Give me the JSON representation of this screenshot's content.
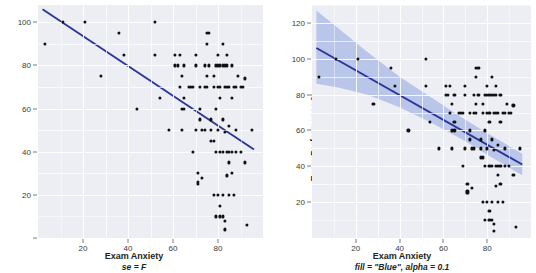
{
  "figure": {
    "background": "#ffffff",
    "panel_background": "#eceef3",
    "grid_color": "#ffffff",
    "point_color": "#111111",
    "line_color": "#2b3499",
    "band_color": "#b9c5e9"
  },
  "panels": [
    {
      "id": "left",
      "ylabel": "Exam Performance %",
      "xlabel": "Exam Anxiety",
      "caption": "se = F",
      "yticks": [
        20,
        40,
        60,
        80,
        100
      ],
      "xticks": [
        20,
        40,
        60,
        80
      ],
      "ylim": [
        0,
        108
      ],
      "xlim": [
        0,
        100
      ],
      "show_band": false,
      "fit_line": {
        "x1": 2,
        "y1": 106,
        "x2": 96,
        "y2": 41
      }
    },
    {
      "id": "right",
      "ylabel": "Exam Performance %",
      "xlabel": "Exam Anxiety",
      "caption": "fill = \"Blue\", alpha = 0.1",
      "yticks": [
        20,
        40,
        60,
        80,
        100,
        120
      ],
      "xticks": [
        20,
        40,
        60,
        80
      ],
      "ylim": [
        0,
        130
      ],
      "xlim": [
        0,
        100
      ],
      "show_band": true,
      "fit_line": {
        "x1": 2,
        "y1": 106,
        "x2": 96,
        "y2": 41
      },
      "band_upper": [
        [
          2,
          127
        ],
        [
          12,
          117
        ],
        [
          25,
          104
        ],
        [
          40,
          90
        ],
        [
          55,
          78
        ],
        [
          70,
          66
        ],
        [
          82,
          57
        ],
        [
          96,
          47
        ]
      ],
      "band_lower": [
        [
          2,
          86
        ],
        [
          12,
          84
        ],
        [
          25,
          80
        ],
        [
          40,
          73
        ],
        [
          55,
          64
        ],
        [
          70,
          54
        ],
        [
          82,
          45
        ],
        [
          96,
          35
        ]
      ]
    }
  ],
  "chart_data": {
    "type": "scatter",
    "title": "",
    "xlabel": "Exam Anxiety",
    "ylabel": "Exam Performance %",
    "xlim": [
      0,
      100
    ],
    "ylim_left": [
      0,
      108
    ],
    "ylim_right": [
      0,
      130
    ],
    "grid": true,
    "legend": "none",
    "annotations": [
      "se = F",
      "fill = \"Blue\", alpha = 0.1"
    ],
    "regression_line": {
      "x_start": 2,
      "y_start": 106,
      "x_end": 96,
      "y_end": 41
    },
    "points": [
      [
        3,
        90
      ],
      [
        11,
        100
      ],
      [
        21,
        100
      ],
      [
        28,
        75
      ],
      [
        36,
        95
      ],
      [
        38,
        85
      ],
      [
        44,
        60
      ],
      [
        52,
        100
      ],
      [
        52,
        85
      ],
      [
        54,
        65
      ],
      [
        58,
        50
      ],
      [
        61,
        80
      ],
      [
        61,
        85
      ],
      [
        62,
        80
      ],
      [
        63,
        70
      ],
      [
        63,
        85
      ],
      [
        64,
        60
      ],
      [
        64,
        75
      ],
      [
        64,
        50
      ],
      [
        65,
        80
      ],
      [
        65,
        65
      ],
      [
        65,
        60
      ],
      [
        67,
        70
      ],
      [
        68,
        70
      ],
      [
        69,
        70
      ],
      [
        69,
        40
      ],
      [
        70,
        85
      ],
      [
        70,
        80
      ],
      [
        70,
        50
      ],
      [
        71,
        30
      ],
      [
        71,
        25
      ],
      [
        71,
        26
      ],
      [
        72,
        60
      ],
      [
        72,
        55
      ],
      [
        72,
        70
      ],
      [
        73,
        50
      ],
      [
        73,
        28
      ],
      [
        74,
        80
      ],
      [
        74,
        70
      ],
      [
        74,
        50
      ],
      [
        75,
        90
      ],
      [
        75,
        95
      ],
      [
        75,
        70
      ],
      [
        75,
        75
      ],
      [
        76,
        95
      ],
      [
        76,
        80
      ],
      [
        77,
        50
      ],
      [
        77,
        55
      ],
      [
        77,
        45
      ],
      [
        78,
        75
      ],
      [
        78,
        70
      ],
      [
        78,
        45
      ],
      [
        78,
        20
      ],
      [
        79,
        80
      ],
      [
        79,
        60
      ],
      [
        79,
        40
      ],
      [
        79,
        10
      ],
      [
        80,
        80
      ],
      [
        80,
        85
      ],
      [
        80,
        70
      ],
      [
        80,
        50
      ],
      [
        80,
        20
      ],
      [
        81,
        80
      ],
      [
        81,
        70
      ],
      [
        81,
        65
      ],
      [
        81,
        40
      ],
      [
        81,
        15
      ],
      [
        81,
        10
      ],
      [
        82,
        80
      ],
      [
        82,
        90
      ],
      [
        82,
        55
      ],
      [
        82,
        40
      ],
      [
        82,
        20
      ],
      [
        82,
        10
      ],
      [
        83,
        80
      ],
      [
        83,
        70
      ],
      [
        83,
        49
      ],
      [
        83,
        8
      ],
      [
        83,
        4
      ],
      [
        84,
        85
      ],
      [
        84,
        80
      ],
      [
        84,
        70
      ],
      [
        84,
        40
      ],
      [
        84,
        29
      ],
      [
        85,
        70
      ],
      [
        85,
        52
      ],
      [
        85,
        40
      ],
      [
        85,
        35
      ],
      [
        85,
        20
      ],
      [
        86,
        80
      ],
      [
        86,
        65
      ],
      [
        86,
        40
      ],
      [
        86,
        30
      ],
      [
        87,
        70
      ],
      [
        87,
        20
      ],
      [
        88,
        70
      ],
      [
        88,
        50
      ],
      [
        88,
        40
      ],
      [
        89,
        75
      ],
      [
        90,
        70
      ],
      [
        90,
        40
      ],
      [
        91,
        70
      ],
      [
        92,
        74
      ],
      [
        92,
        35
      ],
      [
        93,
        6
      ],
      [
        95,
        50
      ]
    ]
  }
}
